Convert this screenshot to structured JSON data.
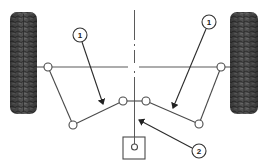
{
  "diagram": {
    "colors": {
      "line": "#4a4a4a",
      "tire_dark": "#3a3a3a",
      "tire_mid": "#6a6a6a",
      "background": "#ffffff"
    },
    "callouts": [
      {
        "id": "callout-1-left",
        "label": "1"
      },
      {
        "id": "callout-1-right",
        "label": "1"
      },
      {
        "id": "callout-2",
        "label": "2"
      }
    ],
    "components": {
      "left_wheel": "tire",
      "right_wheel": "tire",
      "center_line": "dash-dot centerline",
      "reference_box": "square with pivot point"
    }
  }
}
